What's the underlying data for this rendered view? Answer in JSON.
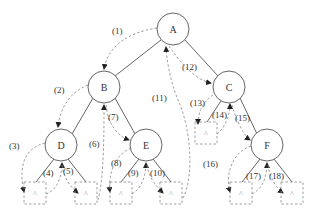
{
  "diagram": {
    "type": "binary-tree-traversal",
    "nodes": [
      {
        "id": "A",
        "label": "A"
      },
      {
        "id": "B",
        "label": "B"
      },
      {
        "id": "C",
        "label": "C"
      },
      {
        "id": "D",
        "label": "D"
      },
      {
        "id": "E",
        "label": "E"
      },
      {
        "id": "F",
        "label": "F"
      }
    ],
    "null_symbol": "^",
    "edges": [
      [
        "A",
        "B"
      ],
      [
        "A",
        "C"
      ],
      [
        "B",
        "D"
      ],
      [
        "B",
        "E"
      ],
      [
        "C",
        "F"
      ]
    ],
    "steps": [
      {
        "n": 1,
        "label": "(1)"
      },
      {
        "n": 2,
        "label": "(2)"
      },
      {
        "n": 3,
        "label": "(3)"
      },
      {
        "n": 4,
        "label": "(4)"
      },
      {
        "n": 5,
        "label": "(5)"
      },
      {
        "n": 6,
        "label": "(6)"
      },
      {
        "n": 7,
        "label": "(7)"
      },
      {
        "n": 8,
        "label": "(8)"
      },
      {
        "n": 9,
        "label": "(9)"
      },
      {
        "n": 10,
        "label": "(10)"
      },
      {
        "n": 11,
        "label": "(11)"
      },
      {
        "n": 12,
        "label": "(12)"
      },
      {
        "n": 13,
        "label": "(13)"
      },
      {
        "n": 14,
        "label": "(14)"
      },
      {
        "n": 15,
        "label": "(15)"
      },
      {
        "n": 16,
        "label": "(16)"
      },
      {
        "n": 17,
        "label": "(17)"
      },
      {
        "n": 18,
        "label": "(18)"
      }
    ]
  }
}
